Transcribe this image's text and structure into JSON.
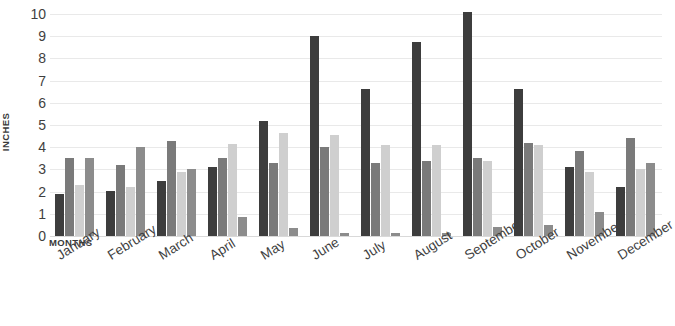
{
  "chart_data": {
    "type": "bar",
    "title": "",
    "subtitle": "",
    "xlabel": "MONTHS",
    "ylabel": "INCHES",
    "ylim": [
      0,
      10
    ],
    "ytick_labels": [
      "0",
      "1",
      "2",
      "3",
      "4",
      "5",
      "6",
      "7",
      "8",
      "9",
      "10"
    ],
    "grid": true,
    "legend_position": "none",
    "categories": [
      "January",
      "February",
      "March",
      "April",
      "May",
      "June",
      "July",
      "August",
      "September",
      "October",
      "November",
      "December"
    ],
    "series": [
      {
        "name": "series-1",
        "color": "#3d3d3d",
        "values": [
          1.9,
          2.05,
          2.5,
          3.1,
          5.2,
          9.0,
          6.6,
          8.75,
          10.1,
          6.6,
          3.1,
          2.2
        ]
      },
      {
        "name": "series-2",
        "color": "#7a7a7a",
        "values": [
          3.5,
          3.2,
          4.3,
          3.5,
          3.3,
          4.0,
          3.3,
          3.4,
          3.5,
          4.2,
          3.85,
          4.4
        ]
      },
      {
        "name": "series-3",
        "color": "#cfcfcf",
        "values": [
          2.3,
          2.2,
          2.9,
          4.15,
          4.65,
          4.55,
          4.1,
          4.1,
          3.4,
          4.1,
          2.9,
          3.0
        ]
      },
      {
        "name": "series-4",
        "color": "#8c8c8c",
        "values": [
          3.5,
          4.0,
          3.0,
          0.85,
          0.35,
          0.15,
          0.12,
          0.15,
          0.4,
          0.5,
          1.1,
          3.3
        ]
      }
    ]
  },
  "colors": {
    "background": "#ffffff",
    "gridline": "#e9e9e9",
    "baseline": "#d9d9d9",
    "text": "#3f3f3f"
  }
}
